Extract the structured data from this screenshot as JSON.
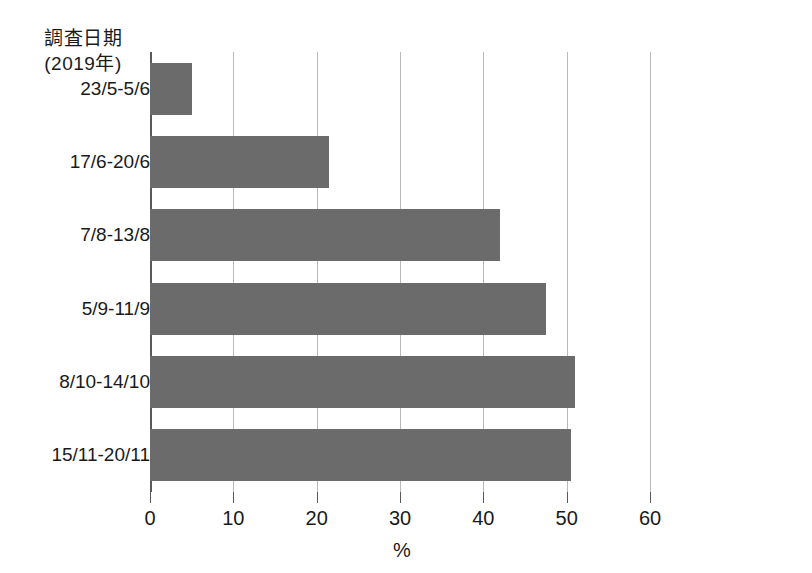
{
  "chart_data": {
    "type": "bar",
    "orientation": "horizontal",
    "title": "",
    "subtitle": "",
    "xlabel": "%",
    "ylabel": "調査日期\n(2019年)",
    "ylabel_lines": [
      "調査日期",
      "(2019年)"
    ],
    "categories": [
      "23/5-5/6",
      "17/6-20/6",
      "7/8-13/8",
      "5/9-11/9",
      "8/10-14/10",
      "15/11-20/11"
    ],
    "values": [
      5,
      21.5,
      42,
      47.5,
      51,
      50.5
    ],
    "series": [
      {
        "name": "",
        "values": [
          5,
          21.5,
          42,
          47.5,
          51,
          50.5
        ]
      }
    ],
    "xlim": [
      0,
      60
    ],
    "xticks": [
      0,
      10,
      20,
      30,
      40,
      50,
      60
    ],
    "xtick_labels": [
      "0",
      "10",
      "20",
      "30",
      "40",
      "50",
      "60"
    ],
    "grid": "vertical",
    "legend": "none",
    "bar_color": "#6b6b6b",
    "grid_color": "#b9b9b9",
    "axis_color": "#5a5a5a"
  }
}
